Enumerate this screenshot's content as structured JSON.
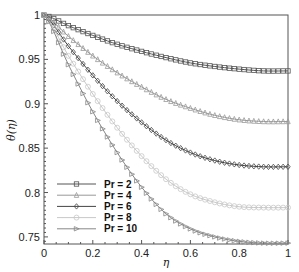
{
  "chart_data": {
    "type": "line",
    "title": "",
    "xlabel": "η",
    "ylabel": "θ(η)",
    "xlim": [
      0,
      1
    ],
    "ylim": [
      0.742,
      1.0
    ],
    "xticks": [
      0,
      0.2,
      0.4,
      0.6,
      0.8,
      1
    ],
    "xtick_labels": [
      "0",
      "0.2",
      "0.4",
      "0.6",
      "0.8",
      "1"
    ],
    "yticks": [
      0.75,
      0.8,
      0.85,
      0.9,
      0.95,
      1
    ],
    "ytick_labels": [
      "0.75",
      "0.8",
      "0.85",
      "0.9",
      "0.95",
      "1"
    ],
    "grid": false,
    "legend_position": "bottom-left",
    "x": [
      0,
      0.1,
      0.2,
      0.3,
      0.4,
      0.5,
      0.6,
      0.7,
      0.8,
      0.9,
      1.0
    ],
    "series": [
      {
        "name": "Pr = 2",
        "marker": "square",
        "color": "#555555",
        "values": [
          1.0,
          0.988,
          0.977,
          0.967,
          0.959,
          0.952,
          0.946,
          0.942,
          0.939,
          0.937,
          0.937
        ]
      },
      {
        "name": "Pr = 4",
        "marker": "triangle-up",
        "color": "#999999",
        "values": [
          1.0,
          0.976,
          0.954,
          0.935,
          0.919,
          0.905,
          0.895,
          0.887,
          0.882,
          0.88,
          0.88
        ]
      },
      {
        "name": "Pr = 6",
        "marker": "diamond",
        "color": "#444444",
        "values": [
          1.0,
          0.965,
          0.932,
          0.903,
          0.879,
          0.859,
          0.845,
          0.836,
          0.831,
          0.829,
          0.829
        ]
      },
      {
        "name": "Pr = 8",
        "marker": "circle",
        "color": "#c8c8c8",
        "values": [
          1.0,
          0.954,
          0.911,
          0.873,
          0.841,
          0.815,
          0.798,
          0.789,
          0.784,
          0.783,
          0.783
        ]
      },
      {
        "name": "Pr = 10",
        "marker": "triangle-right",
        "color": "#888888",
        "values": [
          1.0,
          0.944,
          0.891,
          0.845,
          0.806,
          0.776,
          0.759,
          0.75,
          0.745,
          0.743,
          0.743
        ]
      }
    ]
  }
}
